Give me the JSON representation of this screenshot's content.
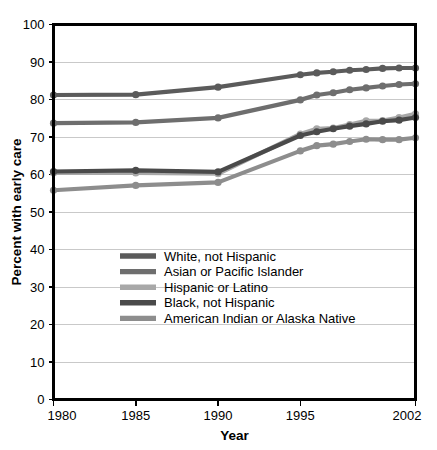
{
  "chart_data": {
    "type": "line",
    "title": "",
    "xlabel": "Year",
    "ylabel": "Percent with early care",
    "xlim": [
      1980,
      2002
    ],
    "ylim": [
      0,
      100
    ],
    "xticks": [
      1980,
      1985,
      1990,
      1995,
      2002
    ],
    "xtick_labels": [
      "1980",
      "1985",
      "1990",
      "1995",
      "2002"
    ],
    "yticks": [
      0,
      10,
      20,
      30,
      40,
      50,
      60,
      70,
      80,
      90,
      100
    ],
    "ytick_labels": [
      "0",
      "10",
      "20",
      "30",
      "40",
      "50",
      "60",
      "70",
      "80",
      "90",
      "100"
    ],
    "grid": true,
    "grid_axis": "y",
    "legend_position": "inside-lower-left",
    "series": [
      {
        "name": "White, not Hispanic",
        "color": "#5b5b5b",
        "x": [
          1980,
          1985,
          1990,
          1995,
          1996,
          1997,
          1998,
          1999,
          2000,
          2001,
          2002
        ],
        "values": [
          81.2,
          81.3,
          83.3,
          86.6,
          87.1,
          87.4,
          87.8,
          88.0,
          88.3,
          88.4,
          88.4
        ]
      },
      {
        "name": "Asian or Pacific Islander",
        "color": "#6e6e6e",
        "x": [
          1980,
          1985,
          1990,
          1995,
          1996,
          1997,
          1998,
          1999,
          2000,
          2001,
          2002
        ],
        "values": [
          73.7,
          73.9,
          75.1,
          79.9,
          81.2,
          81.8,
          82.6,
          83.1,
          83.6,
          84.0,
          84.2
        ]
      },
      {
        "name": "Hispanic or Latino",
        "color": "#a8a8a8",
        "x": [
          1980,
          1985,
          1990,
          1995,
          1996,
          1997,
          1998,
          1999,
          2000,
          2001,
          2002
        ],
        "values": [
          60.4,
          60.4,
          60.2,
          70.8,
          72.2,
          72.4,
          73.3,
          74.3,
          74.4,
          75.2,
          76.2
        ]
      },
      {
        "name": "Black, not Hispanic",
        "color": "#4a4a4a",
        "x": [
          1980,
          1985,
          1990,
          1995,
          1996,
          1997,
          1998,
          1999,
          2000,
          2001,
          2002
        ],
        "values": [
          60.8,
          61.1,
          60.7,
          70.4,
          71.4,
          72.2,
          72.9,
          73.5,
          74.2,
          74.5,
          75.2
        ]
      },
      {
        "name": "American Indian or Alaska Native",
        "color": "#8d8d8d",
        "x": [
          1980,
          1985,
          1990,
          1995,
          1996,
          1997,
          1998,
          1999,
          2000,
          2001,
          2002
        ],
        "values": [
          55.8,
          57.1,
          57.9,
          66.3,
          67.7,
          68.1,
          68.8,
          69.4,
          69.3,
          69.3,
          69.8
        ]
      }
    ]
  },
  "legend": {
    "entries": [
      {
        "label": "White, not Hispanic",
        "color": "#5b5b5b"
      },
      {
        "label": "Asian or Pacific Islander",
        "color": "#6e6e6e"
      },
      {
        "label": "Hispanic or Latino",
        "color": "#a8a8a8"
      },
      {
        "label": "Black, not Hispanic",
        "color": "#4a4a4a"
      },
      {
        "label": "American Indian or Alaska Native",
        "color": "#8d8d8d"
      }
    ]
  },
  "colors": {
    "background": "#ffffff",
    "axis": "#000000",
    "grid": "#c9c9c9",
    "text": "#000000"
  }
}
